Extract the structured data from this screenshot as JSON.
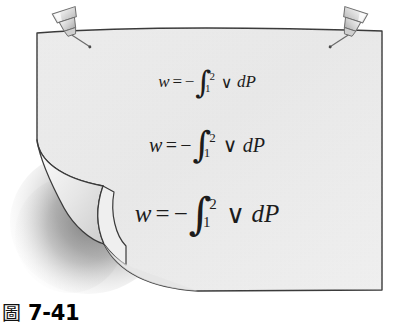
{
  "figure": {
    "caption_symbol": "圖",
    "caption_symbol_name": "cjk-figure-character",
    "caption_number": "7-41",
    "illustration_name": "pinned-curled-paper",
    "paper_fill": "#e9e9e9",
    "paper_fill_light": "#f3f3f3",
    "paper_outline": "#3a3a3a",
    "shadow_color": "#9a9a9a",
    "pin_fill": "#d8d8d8",
    "pin_outline": "#6a6a6a",
    "text_color": "#1c1c1c"
  },
  "equations": [
    {
      "id": "equation-small",
      "size": "small",
      "lhs": "w",
      "equals": "=",
      "minus": "−",
      "integral_glyph": "∫",
      "lower_limit": "1",
      "upper_limit": "2",
      "integrand": "∨",
      "differential": "dP",
      "plain_text": "w = −∫₁² ∨ dP"
    },
    {
      "id": "equation-medium",
      "size": "medium",
      "lhs": "w",
      "equals": "=",
      "minus": "−",
      "integral_glyph": "∫",
      "lower_limit": "1",
      "upper_limit": "2",
      "integrand": "∨",
      "differential": "dP",
      "plain_text": "w = −∫₁² ∨ dP"
    },
    {
      "id": "equation-large",
      "size": "large",
      "lhs": "w",
      "equals": "=",
      "minus": "−",
      "integral_glyph": "∫",
      "lower_limit": "1",
      "upper_limit": "2",
      "integrand": "∨",
      "differential": "dP",
      "plain_text": "w = −∫₁² ∨ dP"
    }
  ],
  "pins": [
    {
      "name": "pushpin-top-left",
      "position": "top-left"
    },
    {
      "name": "pushpin-top-right",
      "position": "top-right"
    }
  ]
}
